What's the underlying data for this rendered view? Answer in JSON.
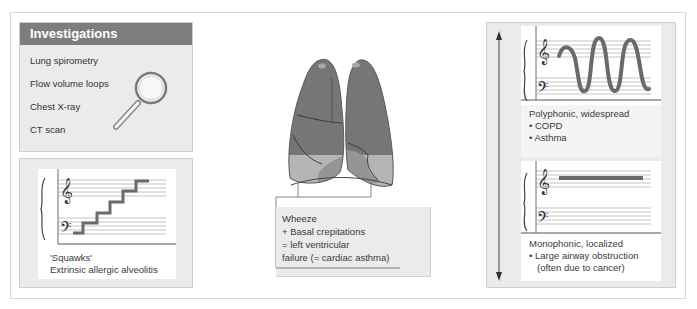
{
  "investigations": {
    "title": "Investigations",
    "items": [
      {
        "label": "Lung spirometry"
      },
      {
        "label": "Flow volume loops"
      },
      {
        "label": "Chest X-ray"
      },
      {
        "label": "CT scan"
      }
    ],
    "icon": "magnifying-glass-icon"
  },
  "squawks": {
    "line1": "'Squawks'",
    "line2": "Extrinsic allergic alveolitis",
    "diagram": "staircase-staff"
  },
  "lungs": {
    "icon": "lungs-illustration",
    "caption": {
      "line1": "Wheeze",
      "line2": "+ Basal crepitations",
      "line3": "= left ventricular",
      "line4": "failure (= cardiac asthma)"
    }
  },
  "polyphonic": {
    "heading": "Polyphonic, widespread",
    "bullets": [
      "• COPD",
      "• Asthma"
    ],
    "diagram": "wave-staff"
  },
  "monophonic": {
    "heading": "Monophonic, localized",
    "bullets": [
      "• Large airway obstruction",
      "(often due to cancer)"
    ],
    "diagram": "flat-line-staff"
  },
  "colors": {
    "header_bg": "#7d7d7d",
    "panel_bg": "#ebebeb",
    "lung_dark": "#737373",
    "lung_light": "#b4b4b4",
    "line": "#555555"
  }
}
